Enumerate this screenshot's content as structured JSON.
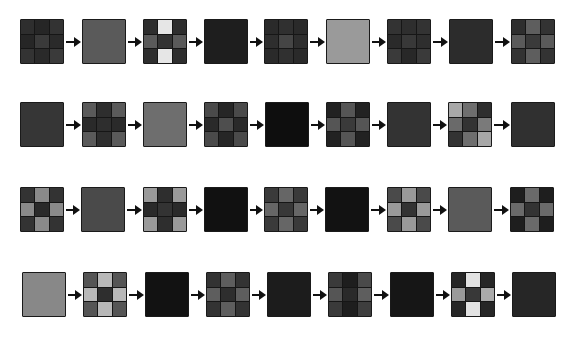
{
  "diagram": {
    "colors": {
      "border": "#1a1a1a",
      "arrow": "#111111",
      "background": "#ffffff"
    },
    "rows": [
      {
        "top": 19,
        "squares": [
          {
            "x": 20,
            "type": "grid",
            "cells": [
              "#2e2e2e",
              "#262626",
              "#333333",
              "#262626",
              "#3a3a3a",
              "#2a2a2a",
              "#333333",
              "#2a2a2a",
              "#3a3a3a"
            ]
          },
          {
            "x": 82,
            "type": "solid",
            "fill": "#5a5a5a"
          },
          {
            "x": 143,
            "type": "grid",
            "cells": [
              "#2e2e2e",
              "#e6e6e6",
              "#2e2e2e",
              "#5a5a5a",
              "#333333",
              "#5a5a5a",
              "#2e2e2e",
              "#e6e6e6",
              "#2e2e2e"
            ]
          },
          {
            "x": 204,
            "type": "solid",
            "fill": "#1e1e1e"
          },
          {
            "x": 264,
            "type": "grid",
            "cells": [
              "#2a2a2a",
              "#303030",
              "#2a2a2a",
              "#2e2e2e",
              "#454545",
              "#2e2e2e",
              "#2a2a2a",
              "#303030",
              "#2a2a2a"
            ]
          },
          {
            "x": 326,
            "type": "solid",
            "fill": "#9a9a9a"
          },
          {
            "x": 387,
            "type": "grid",
            "cells": [
              "#333333",
              "#2e2e2e",
              "#333333",
              "#2a2a2a",
              "#383838",
              "#2e2e2e",
              "#3a3a3a",
              "#282828",
              "#3a3a3a"
            ]
          },
          {
            "x": 449,
            "type": "solid",
            "fill": "#2c2c2c"
          },
          {
            "x": 511,
            "type": "grid",
            "cells": [
              "#2e2e2e",
              "#5e5e5e",
              "#333333",
              "#5a5a5a",
              "#3a3a3a",
              "#5a5a5a",
              "#333333",
              "#5e5e5e",
              "#333333"
            ]
          }
        ]
      },
      {
        "top": 102,
        "squares": [
          {
            "x": 20,
            "type": "solid",
            "fill": "#363636"
          },
          {
            "x": 82,
            "type": "grid",
            "cells": [
              "#5a5a5a",
              "#2e2e2e",
              "#5a5a5a",
              "#2a2a2a",
              "#2e2e2e",
              "#2a2a2a",
              "#5a5a5a",
              "#2e2e2e",
              "#5a5a5a"
            ]
          },
          {
            "x": 143,
            "type": "solid",
            "fill": "#6e6e6e"
          },
          {
            "x": 204,
            "type": "grid",
            "cells": [
              "#4a4a4a",
              "#262626",
              "#4a4a4a",
              "#2a2a2a",
              "#4e4e4e",
              "#2a2a2a",
              "#4a4a4a",
              "#262626",
              "#4a4a4a"
            ]
          },
          {
            "x": 265,
            "type": "solid",
            "fill": "#0e0e0e"
          },
          {
            "x": 326,
            "type": "grid",
            "cells": [
              "#222222",
              "#555555",
              "#222222",
              "#555555",
              "#3a3a3a",
              "#555555",
              "#222222",
              "#555555",
              "#222222"
            ]
          },
          {
            "x": 387,
            "type": "solid",
            "fill": "#333333"
          },
          {
            "x": 448,
            "type": "grid",
            "cells": [
              "#a8a8a8",
              "#6e6e6e",
              "#2e2e2e",
              "#6a6a6a",
              "#333333",
              "#7a7a7a",
              "#333333",
              "#6e6e6e",
              "#a8a8a8"
            ]
          },
          {
            "x": 511,
            "type": "solid",
            "fill": "#303030"
          }
        ]
      },
      {
        "top": 187,
        "squares": [
          {
            "x": 20,
            "type": "grid",
            "cells": [
              "#333333",
              "#8a8a8a",
              "#333333",
              "#8a8a8a",
              "#2a2a2a",
              "#8a8a8a",
              "#333333",
              "#8a8a8a",
              "#333333"
            ]
          },
          {
            "x": 81,
            "type": "solid",
            "fill": "#4a4a4a"
          },
          {
            "x": 143,
            "type": "grid",
            "cells": [
              "#9a9a9a",
              "#2e2e2e",
              "#9a9a9a",
              "#2a2a2a",
              "#333333",
              "#2a2a2a",
              "#9a9a9a",
              "#2e2e2e",
              "#9a9a9a"
            ]
          },
          {
            "x": 204,
            "type": "solid",
            "fill": "#111111"
          },
          {
            "x": 264,
            "type": "grid",
            "cells": [
              "#3a3a3a",
              "#666666",
              "#3a3a3a",
              "#666666",
              "#383838",
              "#666666",
              "#3a3a3a",
              "#666666",
              "#3a3a3a"
            ]
          },
          {
            "x": 325,
            "type": "solid",
            "fill": "#121212"
          },
          {
            "x": 387,
            "type": "grid",
            "cells": [
              "#4a4a4a",
              "#9a9a9a",
              "#4a4a4a",
              "#9a9a9a",
              "#333333",
              "#9a9a9a",
              "#4a4a4a",
              "#9a9a9a",
              "#4a4a4a"
            ]
          },
          {
            "x": 448,
            "type": "solid",
            "fill": "#5a5a5a"
          },
          {
            "x": 510,
            "type": "grid",
            "cells": [
              "#1e1e1e",
              "#6a6a6a",
              "#1e1e1e",
              "#6a6a6a",
              "#333333",
              "#6a6a6a",
              "#1e1e1e",
              "#6a6a6a",
              "#1e1e1e"
            ]
          }
        ]
      },
      {
        "top": 272,
        "squares": [
          {
            "x": 22,
            "type": "solid",
            "fill": "#888888"
          },
          {
            "x": 83,
            "type": "grid",
            "cells": [
              "#555555",
              "#b8b8b8",
              "#555555",
              "#b8b8b8",
              "#2e2e2e",
              "#b8b8b8",
              "#555555",
              "#b8b8b8",
              "#555555"
            ]
          },
          {
            "x": 145,
            "type": "solid",
            "fill": "#121212"
          },
          {
            "x": 206,
            "type": "grid",
            "cells": [
              "#333333",
              "#5e5e5e",
              "#333333",
              "#5e5e5e",
              "#2e2e2e",
              "#5e5e5e",
              "#333333",
              "#5e5e5e",
              "#333333"
            ]
          },
          {
            "x": 267,
            "type": "solid",
            "fill": "#1c1c1c"
          },
          {
            "x": 328,
            "type": "grid",
            "cells": [
              "#3a3a3a",
              "#1e1e1e",
              "#4a4a4a",
              "#555555",
              "#2a2a2a",
              "#5e5e5e",
              "#3a3a3a",
              "#1e1e1e",
              "#3e3e3e"
            ]
          },
          {
            "x": 390,
            "type": "solid",
            "fill": "#161616"
          },
          {
            "x": 451,
            "type": "grid",
            "cells": [
              "#262626",
              "#e2e2e2",
              "#262626",
              "#9a9a9a",
              "#383838",
              "#aaaaaa",
              "#262626",
              "#e2e2e2",
              "#262626"
            ]
          },
          {
            "x": 512,
            "type": "solid",
            "fill": "#262626"
          }
        ]
      }
    ]
  }
}
